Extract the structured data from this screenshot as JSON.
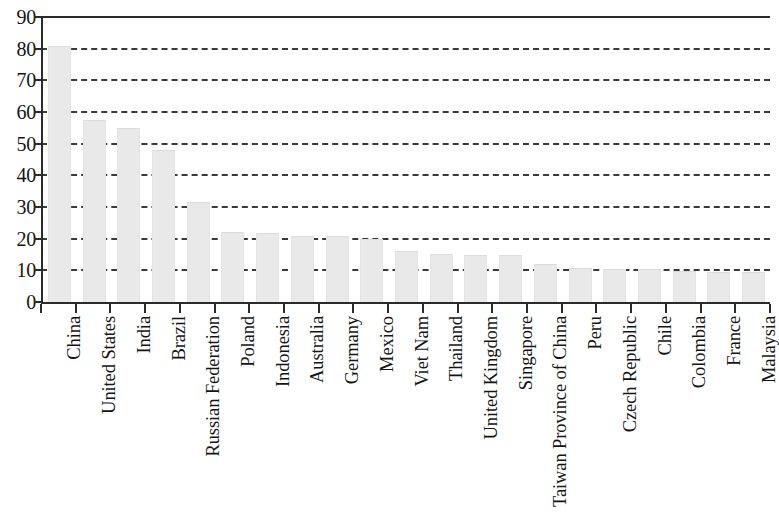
{
  "chart_data": {
    "type": "bar",
    "title": "",
    "subtitle": "",
    "xlabel": "",
    "ylabel": "",
    "ylim": [
      0,
      90
    ],
    "ytick_step": 10,
    "yticks": [
      0,
      10,
      20,
      30,
      40,
      50,
      60,
      70,
      80,
      90
    ],
    "grid": true,
    "grid_axis": "y",
    "grid_style": "dashed",
    "legend": null,
    "legend_position": "none",
    "bar_color": "#e9e9e9",
    "axis_color": "#2b2b2b",
    "label_rotation": 90,
    "categories": [
      "China",
      "United States",
      "India",
      "Brazil",
      "Russian Federation",
      "Poland",
      "Indonesia",
      "Australia",
      "Germany",
      "Mexico",
      "Viet Nam",
      "Thailand",
      "United Kingdom",
      "Singapore",
      "Taiwan Province of China",
      "Peru",
      "Czech Republic",
      "Chile",
      "Colombia",
      "France",
      "Malaysia"
    ],
    "values": [
      81.0,
      57.5,
      55.0,
      48.0,
      31.5,
      22.0,
      21.8,
      21.0,
      21.0,
      20.0,
      16.0,
      15.2,
      15.0,
      14.8,
      12.0,
      10.7,
      10.5,
      10.3,
      9.8,
      9.6,
      9.5
    ]
  }
}
